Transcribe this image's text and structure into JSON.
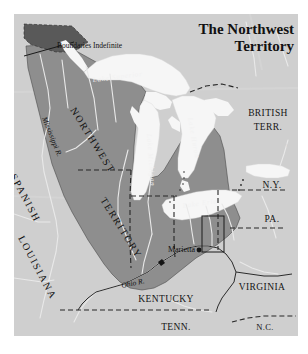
{
  "figure": {
    "kind": "historical-map",
    "width": 308,
    "height": 354,
    "title": "The Northwest Territory"
  },
  "colors": {
    "page_background": "#ffffff",
    "map_background": "#cfcfcf",
    "territory_fill": "#8e8e8e",
    "indefinite_fill": "#595959",
    "lake_fill": "#f6f6f6",
    "river_stroke": "#e8e8e8",
    "border_stroke": "#2b2b2b",
    "text_dark": "#141414",
    "text_light": "#f2f2f2"
  },
  "title": {
    "line1": "The Northwest",
    "line2": "Territory"
  },
  "annotations": {
    "boundaries_note": "Boundaries Indefinite"
  },
  "territory_labels": {
    "northwest": "NORTHWEST",
    "territory": "TERRITORY"
  },
  "foreign_regions": [
    {
      "id": "spanish",
      "label": "SPANISH"
    },
    {
      "id": "louisiana",
      "label": "LOUISIANA"
    },
    {
      "id": "british-terr-1",
      "label": "BRITISH"
    },
    {
      "id": "british-terr-2",
      "label": "TERR."
    }
  ],
  "states": [
    {
      "id": "new-york",
      "label": "N.Y."
    },
    {
      "id": "pennsylvania",
      "label": "PA."
    },
    {
      "id": "virginia",
      "label": "VIRGINIA"
    },
    {
      "id": "kentucky",
      "label": "KENTUCKY"
    },
    {
      "id": "tennessee",
      "label": "TENN."
    },
    {
      "id": "north-carolina",
      "label": "N.C."
    }
  ],
  "lakes": [
    {
      "id": "lake-superior",
      "label": "Lake Superior"
    },
    {
      "id": "lake-michigan",
      "label": "Lake Michigan"
    },
    {
      "id": "lake-huron",
      "label": "Lake Huron"
    },
    {
      "id": "lake-erie",
      "label": "Lake Erie"
    },
    {
      "id": "lake-ontario",
      "label": "Lake Ontario"
    }
  ],
  "rivers": [
    {
      "id": "mississippi-river",
      "label": "Mississippi R."
    },
    {
      "id": "ohio-river",
      "label": "Ohio R."
    }
  ],
  "cities": [
    {
      "id": "marietta",
      "label": "Marietta"
    }
  ]
}
